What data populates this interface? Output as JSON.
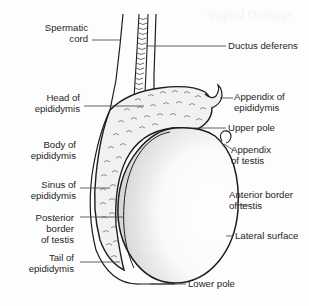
{
  "figure": {
    "background_bleed_text": "Vaginal Drainage",
    "colors": {
      "line": "#1c1c1c",
      "leader": "#3a3a3a",
      "text": "#262626",
      "stipple": "#8a8a8a",
      "epididymis_fill": "#efefef"
    }
  },
  "labels": {
    "left": [
      {
        "id": "spermatic-cord",
        "lines": [
          "Spermatic",
          "cord"
        ]
      },
      {
        "id": "head-of-epididymis",
        "lines": [
          "Head of",
          "epididymis"
        ]
      },
      {
        "id": "body-of-epididymis",
        "lines": [
          "Body of",
          "epididymis"
        ]
      },
      {
        "id": "sinus-of-epididymis",
        "lines": [
          "Sinus of",
          "epididymis"
        ]
      },
      {
        "id": "posterior-border-of-testis",
        "lines": [
          "Posterior",
          "border",
          "of testis"
        ]
      },
      {
        "id": "tail-of-epididymis",
        "lines": [
          "Tail of",
          "epididymis"
        ]
      }
    ],
    "right": [
      {
        "id": "ductus-deferens",
        "lines": [
          "Ductus deferens"
        ]
      },
      {
        "id": "appendix-of-epididymis",
        "lines": [
          "Appendix of",
          "epididymis"
        ]
      },
      {
        "id": "upper-pole",
        "lines": [
          "Upper pole"
        ]
      },
      {
        "id": "appendix-of-testis",
        "lines": [
          "Appendix",
          "of testis"
        ]
      },
      {
        "id": "anterior-border-of-testis",
        "lines": [
          "Anterior border",
          "of testis"
        ]
      },
      {
        "id": "lateral-surface",
        "lines": [
          "Lateral surface"
        ]
      },
      {
        "id": "lower-pole",
        "lines": [
          "Lower pole"
        ]
      }
    ]
  }
}
